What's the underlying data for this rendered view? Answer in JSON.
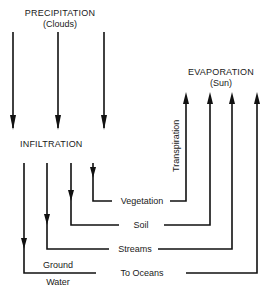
{
  "diagram": {
    "precipitation": {
      "title": "PRECIPITATION",
      "subtitle": "(Clouds)"
    },
    "evaporation": {
      "title": "EVAPORATION",
      "subtitle": "(Sun)"
    },
    "infiltration": {
      "title": "INFILTRATION"
    },
    "transpiration": {
      "label": "Transpiration"
    },
    "flows": [
      {
        "label": "Vegetation"
      },
      {
        "label": "Soil"
      },
      {
        "label": "Streams"
      },
      {
        "label": "To Oceans"
      }
    ],
    "ground_water": {
      "line1": "Ground",
      "line2": "Water"
    },
    "line_color": "#111111"
  }
}
